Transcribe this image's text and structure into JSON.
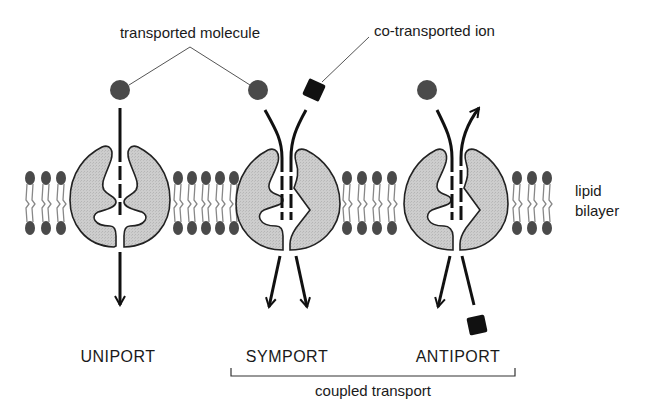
{
  "labels": {
    "transported_molecule": "transported molecule",
    "co_transported_ion": "co-transported ion",
    "lipid_bilayer_line1": "lipid",
    "lipid_bilayer_line2": "bilayer",
    "uniport": "UNIPORT",
    "symport": "SYMPORT",
    "antiport": "ANTIPORT",
    "coupled_transport": "coupled transport"
  },
  "colors": {
    "molecule": "#4a4a4a",
    "ion": "#111111",
    "protein_fill": "#c8c8c8",
    "protein_stroke": "#222222",
    "lipid_head": "#4a4a4a",
    "lipid_tail": "#888888",
    "arrow": "#111111",
    "text": "#1a1a1a"
  },
  "transporters": [
    {
      "name": "uniport",
      "molecules": [
        "transported molecule"
      ],
      "direction": "same"
    },
    {
      "name": "symport",
      "molecules": [
        "transported molecule",
        "co-transported ion"
      ],
      "direction": "same"
    },
    {
      "name": "antiport",
      "molecules": [
        "transported molecule",
        "co-transported ion"
      ],
      "direction": "opposite"
    }
  ]
}
